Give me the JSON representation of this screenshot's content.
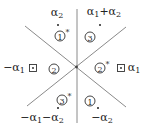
{
  "diagram": {
    "type": "root-system-chamber-diagram",
    "colors": {
      "lines": "#888888",
      "text": "#222222",
      "points": "#222222"
    },
    "roots": [
      {
        "id": "alpha2",
        "label_base": "α",
        "label_sub": "2",
        "prefix": "",
        "marker": "dot"
      },
      {
        "id": "alpha1_plus_alpha2",
        "label": "α1+α2",
        "marker": "dot"
      },
      {
        "id": "neg_alpha1",
        "label_base": "α",
        "label_sub": "1",
        "prefix": "−",
        "marker": "boxed-dot"
      },
      {
        "id": "alpha1",
        "label_base": "α",
        "label_sub": "1",
        "prefix": "",
        "marker": "boxed-dot"
      },
      {
        "id": "neg_alpha1_minus_alpha2",
        "label": "−α1−α2",
        "marker": "dot"
      },
      {
        "id": "neg_alpha2",
        "label_base": "α",
        "label_sub": "2",
        "prefix": "−",
        "marker": "dot"
      }
    ],
    "labels": {
      "alpha2": {
        "a": "α",
        "s": "2"
      },
      "alpha1_plus_alpha2": {
        "a1": "α",
        "s1": "1",
        "plus": "+",
        "a2": "α",
        "s2": "2"
      },
      "neg_alpha1": {
        "m": "−",
        "a": "α",
        "s": "1"
      },
      "alpha1": {
        "a": "α",
        "s": "1"
      },
      "neg_alpha1_minus_alpha2": {
        "m1": "−",
        "a1": "α",
        "s1": "1",
        "m2": "−",
        "a2": "α",
        "s2": "2"
      },
      "neg_alpha2": {
        "m": "−",
        "a": "α",
        "s": "2"
      }
    },
    "regions": [
      {
        "id": "top-left",
        "number": "1",
        "star": "*"
      },
      {
        "id": "top-right",
        "number": "3",
        "star": ""
      },
      {
        "id": "left",
        "number": "2",
        "star": ""
      },
      {
        "id": "right",
        "number": "2",
        "star": "*"
      },
      {
        "id": "bottom-left",
        "number": "3",
        "star": "*"
      },
      {
        "id": "bottom-right",
        "number": "1",
        "star": ""
      }
    ]
  }
}
